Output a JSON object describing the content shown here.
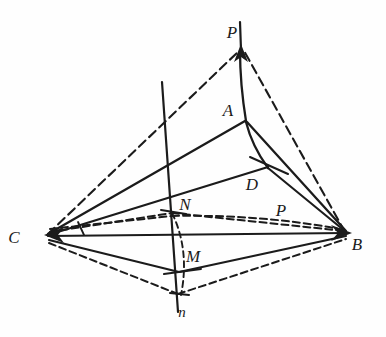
{
  "figure": {
    "background_color": "#fefefe",
    "ink_color": "#1b1b1b",
    "width": 386,
    "height": 337,
    "labels": [
      {
        "id": "P-top",
        "text": "P",
        "x": 232,
        "y": 38,
        "size": 17
      },
      {
        "id": "A",
        "text": "A",
        "x": 228,
        "y": 116,
        "size": 17
      },
      {
        "id": "D",
        "text": "D",
        "x": 252,
        "y": 190,
        "size": 17
      },
      {
        "id": "P-lower",
        "text": "P",
        "x": 281,
        "y": 216,
        "size": 17
      },
      {
        "id": "N",
        "text": "N",
        "x": 185,
        "y": 210,
        "size": 17
      },
      {
        "id": "M",
        "text": "M",
        "x": 193,
        "y": 262,
        "size": 17
      },
      {
        "id": "n",
        "text": "n",
        "x": 182,
        "y": 317,
        "size": 15
      },
      {
        "id": "C",
        "text": "C",
        "x": 14,
        "y": 243,
        "size": 17
      },
      {
        "id": "B",
        "text": "B",
        "x": 357,
        "y": 250,
        "size": 17
      }
    ],
    "vertices": {
      "P_top": {
        "x": 241,
        "y": 45
      },
      "A": {
        "x": 246,
        "y": 121
      },
      "D": {
        "x": 268,
        "y": 166
      },
      "N": {
        "x": 172,
        "y": 212
      },
      "M": {
        "x": 179,
        "y": 272
      },
      "n": {
        "x": 178,
        "y": 294
      },
      "C": {
        "x": 45,
        "y": 235
      },
      "B": {
        "x": 348,
        "y": 233
      },
      "axis_top": {
        "x": 162,
        "y": 82
      },
      "axis_bottom": {
        "x": 178,
        "y": 310
      }
    },
    "edges": [
      {
        "id": "C-to-Ptop",
        "style": "dashed"
      },
      {
        "id": "B-to-Ptop",
        "style": "dashed"
      },
      {
        "id": "A-to-Ptop",
        "style": "solid"
      },
      {
        "id": "C-to-A",
        "style": "solid"
      },
      {
        "id": "A-to-B",
        "style": "solid"
      },
      {
        "id": "A-to-D",
        "style": "solid"
      },
      {
        "id": "C-to-D",
        "style": "solid"
      },
      {
        "id": "D-to-B",
        "style": "solid"
      },
      {
        "id": "C-to-B-axis",
        "style": "solid"
      },
      {
        "id": "C-to-N",
        "style": "dashed"
      },
      {
        "id": "N-to-B",
        "style": "dashed"
      },
      {
        "id": "C-to-P",
        "style": "dashed"
      },
      {
        "id": "P-to-B",
        "style": "dashed"
      },
      {
        "id": "C-to-M",
        "style": "solid"
      },
      {
        "id": "M-to-B",
        "style": "solid"
      },
      {
        "id": "C-to-n",
        "style": "dashed"
      },
      {
        "id": "n-to-B",
        "style": "dashed"
      },
      {
        "id": "N-to-n-arc",
        "style": "dashed"
      },
      {
        "id": "vertical-axis",
        "style": "solid"
      }
    ],
    "tick_marks": [
      {
        "id": "tick-D",
        "x": 268,
        "y": 166
      },
      {
        "id": "tick-N",
        "x": 172,
        "y": 212
      },
      {
        "id": "tick-M",
        "x": 179,
        "y": 272
      },
      {
        "id": "tick-n",
        "x": 178,
        "y": 294
      },
      {
        "id": "tick-C",
        "x": 80,
        "y": 228
      }
    ],
    "arrowheads": [
      {
        "id": "arrow-P-top",
        "at": "P_top"
      },
      {
        "id": "arrow-C",
        "at": "C"
      },
      {
        "id": "arrow-B",
        "at": "B"
      }
    ]
  }
}
